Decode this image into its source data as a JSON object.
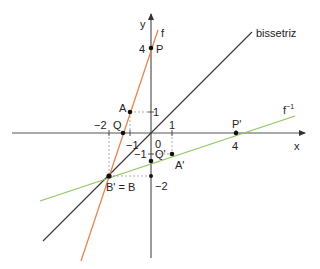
{
  "diagram": {
    "title": "",
    "axes": {
      "x_label": "x",
      "y_label": "y",
      "origin_label": "0",
      "x_ticks": [
        {
          "value": -2,
          "label": "−2"
        },
        {
          "value": -1,
          "label": "−1"
        },
        {
          "value": 1,
          "label": "1"
        },
        {
          "value": 4,
          "label": "4"
        }
      ],
      "y_ticks": [
        {
          "value": 4,
          "label": "4"
        },
        {
          "value": 1,
          "label": "1"
        },
        {
          "value": -1,
          "label": "−1"
        },
        {
          "value": -2,
          "label": "−2"
        }
      ]
    },
    "lines": {
      "f": {
        "label": "f",
        "equation": "y = 3x + 4",
        "color": "#e8824a"
      },
      "f_inverse": {
        "label": "f",
        "superscript": "−1",
        "equation": "y = (x − 4)/3",
        "color": "#8cc45a"
      },
      "bisector": {
        "label": "bissetriz",
        "equation": "y = x",
        "color": "#333333"
      }
    },
    "points": {
      "P": {
        "label": "P",
        "x": 0,
        "y": 4
      },
      "A": {
        "label": "A",
        "x": -1,
        "y": 1
      },
      "Q": {
        "label": "Q",
        "x": -1.333,
        "y": 0
      },
      "B": {
        "label": "B' = B",
        "x": -2,
        "y": -2
      },
      "P_prime": {
        "label": "P'",
        "x": 4,
        "y": 0
      },
      "A_prime": {
        "label": "A'",
        "x": 1,
        "y": -1
      },
      "Q_prime": {
        "label": "Q'",
        "x": 0,
        "y": -1.333
      }
    },
    "colors": {
      "axis": "#555555",
      "guide": "#999999",
      "point": "#111111"
    }
  }
}
